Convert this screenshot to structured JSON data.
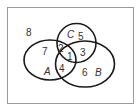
{
  "diagram": {
    "type": "venn",
    "sets": [
      {
        "name": "A",
        "label": "A"
      },
      {
        "name": "B",
        "label": "B"
      },
      {
        "name": "C",
        "label": "C"
      }
    ],
    "regions": {
      "outside": "8",
      "A_only": "7",
      "A_and_C_only": "2",
      "A_B_C": "1",
      "A_and_B_only": "4",
      "C_only": "5",
      "B_and_C_only": "3",
      "B_only": "6"
    },
    "colors": {
      "stroke": "#1a1a1a",
      "frame": "#9a9a9a",
      "text": "#333333"
    }
  }
}
